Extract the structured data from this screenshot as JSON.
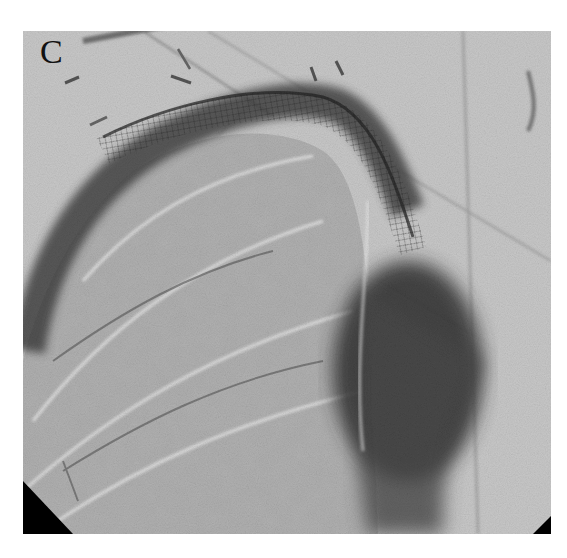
{
  "figure": {
    "panel_label": "C",
    "colors": {
      "background": "#c9c9c9",
      "lung_field": "#b4b4b4",
      "vessel_dark": "#3a3a3a",
      "contrast_dark": "#2a2a2a",
      "corner_mask": "#000000"
    }
  }
}
